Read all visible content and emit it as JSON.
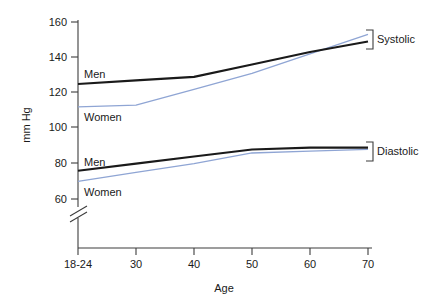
{
  "chart_data": {
    "type": "line",
    "title": "",
    "xlabel": "Age",
    "ylabel": "mm Hg",
    "x": [
      1,
      2,
      3,
      4,
      5,
      6
    ],
    "categories": [
      "18-24",
      "30",
      "40",
      "50",
      "60",
      "70"
    ],
    "xtick_labels": [
      "18-24",
      "30",
      "40",
      "50",
      "60",
      "70"
    ],
    "ytick_labels": [
      "160",
      "140",
      "120",
      "100",
      "80",
      "60"
    ],
    "ytick_values": [
      160,
      140,
      120,
      100,
      80,
      60
    ],
    "ylim": [
      52,
      162
    ],
    "axis_break": true,
    "axis_break_note": "y-axis broken below 60",
    "grid": false,
    "legend_position": "right-brackets",
    "series": [
      {
        "name": "Systolic Men",
        "group": "Systolic",
        "sex": "Men",
        "color": "#1a1a1a",
        "values": [
          125,
          127,
          129,
          136,
          143,
          149
        ]
      },
      {
        "name": "Systolic Women",
        "group": "Systolic",
        "sex": "Women",
        "color": "#8fa5d4",
        "values": [
          112,
          113,
          122,
          131,
          142,
          153
        ]
      },
      {
        "name": "Diastolic Men",
        "group": "Diastolic",
        "sex": "Men",
        "color": "#1a1a1a",
        "values": [
          76,
          80,
          84,
          88,
          89,
          89
        ]
      },
      {
        "name": "Diastolic Women",
        "group": "Diastolic",
        "sex": "Women",
        "color": "#8fa5d4",
        "values": [
          70,
          75,
          80,
          86,
          87,
          88
        ]
      }
    ],
    "group_labels": [
      "Systolic",
      "Diastolic"
    ],
    "inline_labels": [
      {
        "text": "Men",
        "series": "Systolic Men"
      },
      {
        "text": "Women",
        "series": "Systolic Women"
      },
      {
        "text": "Men",
        "series": "Diastolic Men"
      },
      {
        "text": "Women",
        "series": "Diastolic Women"
      }
    ],
    "colors": {
      "men": "#1a1a1a",
      "women": "#8fa5d4",
      "axis": "#3d3d3d",
      "text": "#1a1a1a",
      "background": "#ffffff"
    }
  },
  "labels": {
    "y_axis_title": "mm Hg",
    "x_axis_title": "Age",
    "systolic": "Systolic",
    "diastolic": "Diastolic",
    "men_systolic": "Men",
    "women_systolic": "Women",
    "men_diastolic": "Men",
    "women_diastolic": "Women",
    "ytick_160": "160",
    "ytick_140": "140",
    "ytick_120": "120",
    "ytick_100": "100",
    "ytick_80": "80",
    "ytick_60": "60",
    "xtick_1": "18-24",
    "xtick_2": "30",
    "xtick_3": "40",
    "xtick_4": "50",
    "xtick_5": "60",
    "xtick_6": "70"
  }
}
